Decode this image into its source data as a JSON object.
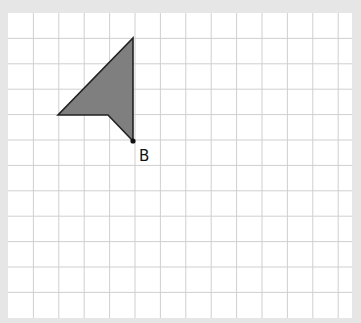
{
  "diagram": {
    "background": "#e6e6e6",
    "grid": {
      "x0": 8,
      "y0": 13,
      "cell": 25.4,
      "cols": 13.5,
      "rows": 12,
      "width": 344,
      "height": 305,
      "paper_color": "#ffffff",
      "line_color": "#cfcfcf"
    },
    "shape": {
      "fill": "#7f7f7f",
      "stroke": "#222222",
      "points": [
        [
          133,
          38
        ],
        [
          133,
          141
        ],
        [
          108,
          115
        ],
        [
          58,
          115
        ]
      ]
    },
    "point_b": {
      "x": 133,
      "y": 141,
      "label": "B",
      "label_x": 139,
      "label_y": 147
    }
  }
}
